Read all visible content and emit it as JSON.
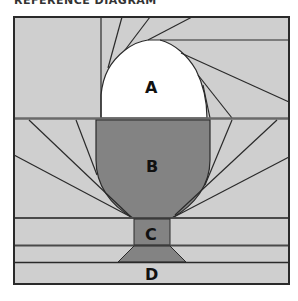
{
  "title": "REFERENCE DIAGRAM",
  "colors": {
    "background": "#ffffff",
    "light_fill": "#cfcfcf",
    "dark_fill": "#838383",
    "highlight_fill": "#ffffff",
    "stroke": "#2a2a2a"
  },
  "sections": [
    {
      "id": "A",
      "label": "A",
      "description": "egg top (white arch)"
    },
    {
      "id": "B",
      "label": "B",
      "description": "egg cup bowl"
    },
    {
      "id": "C",
      "label": "C",
      "description": "egg cup stem"
    },
    {
      "id": "D",
      "label": "D",
      "description": "egg cup base strip"
    }
  ]
}
